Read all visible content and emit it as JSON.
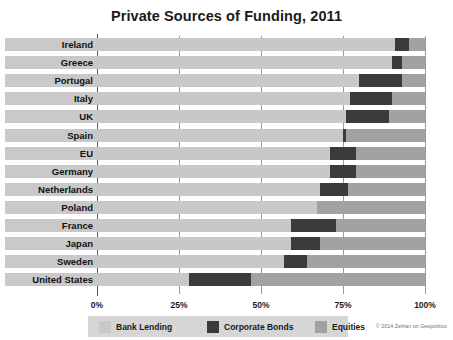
{
  "title": "Private Sources of Funding, 2011",
  "credit": "© 2014 Zeihan on Geopolitics",
  "axis": {
    "ticks": [
      "0%",
      "25%",
      "50%",
      "75%",
      "100%"
    ]
  },
  "legend": {
    "items": [
      {
        "label": "Bank Lending",
        "color": "#c8c8c8"
      },
      {
        "label": "Corporate Bonds",
        "color": "#3b3b3b"
      },
      {
        "label": "Equities",
        "color": "#a2a2a2"
      }
    ]
  },
  "chart_data": {
    "type": "bar",
    "orientation": "horizontal",
    "stacked": true,
    "title": "Private Sources of Funding, 2011",
    "xlabel": "",
    "ylabel": "",
    "xlim": [
      0,
      100
    ],
    "xticks": [
      0,
      25,
      50,
      75,
      100
    ],
    "xtick_labels": [
      "0%",
      "25%",
      "50%",
      "75%",
      "100%"
    ],
    "grid": true,
    "legend_position": "bottom",
    "categories": [
      "Ireland",
      "Greece",
      "Portugal",
      "Italy",
      "UK",
      "Spain",
      "EU",
      "Germany",
      "Netherlands",
      "Poland",
      "France",
      "Japan",
      "Sweden",
      "United States"
    ],
    "series": [
      {
        "name": "Bank Lending",
        "color": "#c8c8c8",
        "values": [
          91,
          90,
          80,
          77,
          76,
          75,
          71,
          71,
          68,
          67,
          59,
          59,
          57,
          28
        ]
      },
      {
        "name": "Corporate Bonds",
        "color": "#3b3b3b",
        "values": [
          4,
          3,
          13,
          13,
          13,
          1,
          8,
          8,
          8.5,
          0,
          14,
          9,
          7,
          19
        ]
      },
      {
        "name": "Equities",
        "color": "#a2a2a2",
        "values": [
          5,
          7,
          7,
          10,
          11,
          24,
          21,
          21,
          23.5,
          33,
          27,
          32,
          36,
          53
        ]
      }
    ]
  }
}
